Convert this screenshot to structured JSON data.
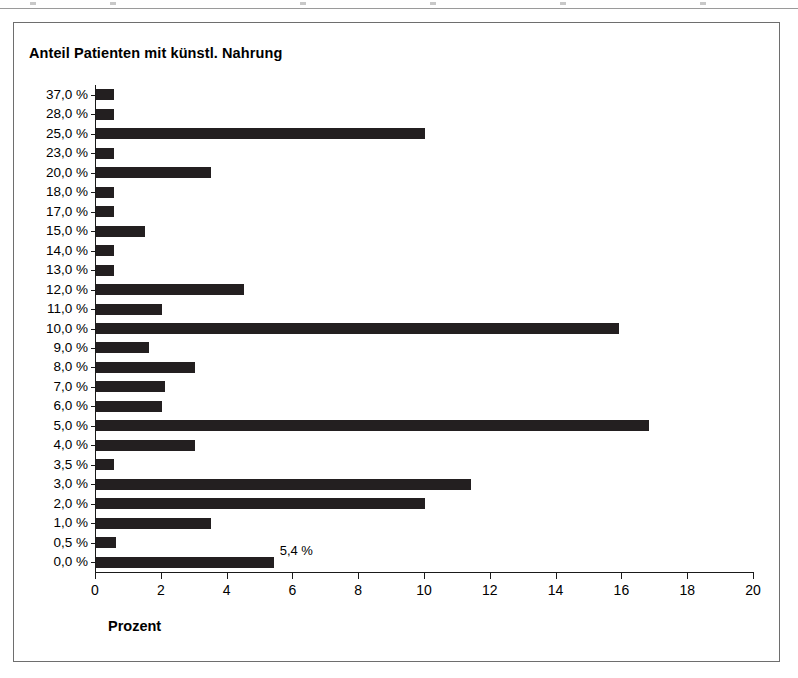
{
  "figure": {
    "title": "Anteil Patienten mit künstl. Nahrung",
    "frame_color": "#6e6e6e",
    "bar_color": "#231f20",
    "axis_color": "#1a1a1a",
    "background": "#ffffff"
  },
  "chart_data": {
    "type": "bar",
    "orientation": "horizontal",
    "title": "Anteil Patienten mit künstl. Nahrung",
    "xlabel": "Prozent",
    "ylabel": "",
    "xlim": [
      0,
      20
    ],
    "xticks": [
      0,
      2,
      4,
      6,
      8,
      10,
      12,
      14,
      16,
      18,
      20
    ],
    "xtick_labels": [
      "0",
      "2",
      "4",
      "6",
      "8",
      "10",
      "12",
      "14",
      "16",
      "18",
      "20"
    ],
    "grid": false,
    "legend": false,
    "categories": [
      "37,0 %",
      "28,0 %",
      "25,0 %",
      "23,0 %",
      "20,0 %",
      "18,0 %",
      "17,0 %",
      "15,0 %",
      "14,0 %",
      "13,0 %",
      "12,0 %",
      "11,0 %",
      "10,0 %",
      "9,0 %",
      "8,0 %",
      "7,0 %",
      "6,0 %",
      "5,0 %",
      "4,0 %",
      "3,5 %",
      "3,0 %",
      "2,0 %",
      "1,0 %",
      "0,5 %",
      "0,0 %"
    ],
    "values": [
      0.55,
      0.55,
      10.0,
      0.55,
      3.5,
      0.55,
      0.55,
      1.5,
      0.55,
      0.55,
      4.5,
      2.0,
      15.9,
      1.6,
      3.0,
      2.1,
      2.0,
      16.8,
      3.0,
      0.55,
      11.4,
      10.0,
      3.5,
      0.6,
      5.4
    ],
    "data_labels": [
      "",
      "",
      "",
      "",
      "",
      "",
      "",
      "",
      "",
      "",
      "",
      "",
      "",
      "",
      "",
      "",
      "",
      "",
      "",
      "",
      "",
      "",
      "",
      "",
      "5,4 %"
    ]
  }
}
